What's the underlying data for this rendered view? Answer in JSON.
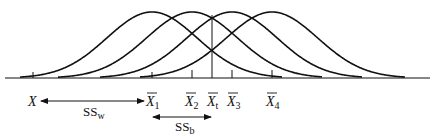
{
  "diagram": {
    "colors": {
      "stroke": "#111111",
      "background": "#ffffff"
    },
    "curves": [
      {
        "name": "group-1",
        "center_x": 152,
        "left_x": 20,
        "right_x": 282
      },
      {
        "name": "group-2",
        "center_x": 192,
        "left_x": 58,
        "right_x": 322
      },
      {
        "name": "group-3",
        "center_x": 232,
        "left_x": 100,
        "right_x": 362
      },
      {
        "name": "group-4",
        "center_x": 272,
        "left_x": 140,
        "right_x": 405
      }
    ],
    "ticks": [
      {
        "name": "X",
        "x": 33
      },
      {
        "name": "X1",
        "x": 152
      },
      {
        "name": "X2",
        "x": 192
      },
      {
        "name": "X3",
        "x": 232
      },
      {
        "name": "X4",
        "x": 272
      }
    ],
    "grand_mean_line_x": 212,
    "labels": {
      "x": "X",
      "x1_main": "X",
      "x1_sub": "1",
      "x2_main": "X",
      "x2_sub": "2",
      "xt_main": "X",
      "xt_sub": "t",
      "x3_main": "X",
      "x3_sub": "3",
      "x4_main": "X",
      "x4_sub": "4",
      "ssw_main": "SS",
      "ssw_sub": "w",
      "ssb_main": "SS",
      "ssb_sub": "b"
    }
  }
}
